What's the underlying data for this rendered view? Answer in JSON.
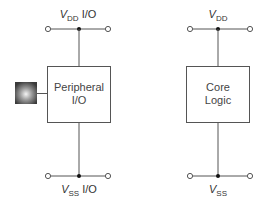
{
  "diagram": {
    "colors": {
      "line": "#555555",
      "text": "#333333",
      "node": "#111111",
      "background": "#ffffff"
    },
    "left_block": {
      "title_line1": "Peripheral",
      "title_line2": "I/O",
      "supply_top": {
        "main": "V",
        "sub": "DD",
        "suffix": " I/O"
      },
      "supply_bottom": {
        "main": "V",
        "sub": "SS",
        "suffix": " I/O"
      },
      "has_pad": true
    },
    "right_block": {
      "title_line1": "Core",
      "title_line2": "Logic",
      "supply_top": {
        "main": "V",
        "sub": "DD",
        "suffix": ""
      },
      "supply_bottom": {
        "main": "V",
        "sub": "SS",
        "suffix": ""
      }
    }
  }
}
